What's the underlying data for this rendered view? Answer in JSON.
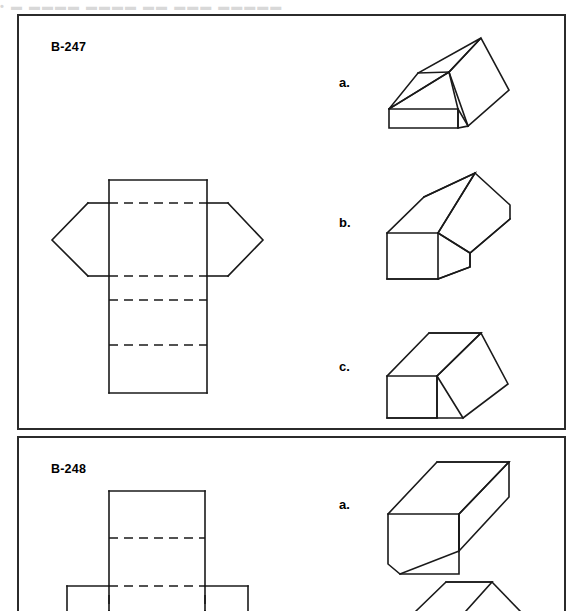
{
  "page": {
    "top_cut_text": "•  ▬ ▬▬▬▬  ▬▬▬▬ ▬▬  ▬▬▬ ▬▬▬▬▬",
    "line_color": "#1a1a1a",
    "border_color": "#2b2b2b",
    "background": "#ffffff"
  },
  "exercises": [
    {
      "id": "B-247",
      "label": "B-247",
      "net": {
        "name": "hexagonal-prism-net",
        "solid_paths": [
          "M 109 180 L 207 180",
          "M 109 180 L 109 203",
          "M 207 180 L 207 203",
          "M 88 203 L 109 203",
          "M 207 203 L 228 203",
          "M 88 203 L 52 240 L 88 276",
          "M 228 203 L 263 240 L 228 276",
          "M 88 276 L 109 276",
          "M 207 276 L 228 276",
          "M 109 203 L 109 393",
          "M 207 203 L 207 393",
          "M 109 393 L 207 393"
        ],
        "dashed_paths": [
          "M 109 203 L 207 203",
          "M 109 276 L 207 276",
          "M 109 300 L 207 300",
          "M 109 345 L 207 345"
        ]
      },
      "options": [
        {
          "letter": "a.",
          "name": "option-a-solid",
          "paths": [
            "M 389 109 L 389 128 L 458 128 L 458 109 L 389 109",
            "M 389 109 L 418 73 L 481 38 L 449 72 L 389 109",
            "M 418 73 L 449 72",
            "M 449 72 L 481 38 L 509 90 L 468 126 L 449 72",
            "M 449 72 L 458 109 L 458 128 L 468 126",
            "M 458 109 L 468 126",
            "M 389 109 L 449 72"
          ]
        },
        {
          "letter": "b.",
          "name": "option-b-solid",
          "paths": [
            "M 387 233 L 387 279 L 438 279 L 438 233 L 387 233",
            "M 387 233 L 424 197 L 475 173 L 438 233",
            "M 424 197 L 475 173",
            "M 475 173 L 510 205 L 510 219 L 470 253 L 438 233 L 475 173",
            "M 438 233 L 470 253 L 470 267 L 438 279",
            "M 470 253 L 510 219",
            "M 470 253 L 470 267 L 438 279",
            "M 387 279 L 438 279"
          ]
        },
        {
          "letter": "c.",
          "name": "option-c-solid",
          "paths": [
            "M 387 376 L 387 418 L 437 418 L 437 376 L 387 376",
            "M 387 376 L 429 333 L 481 333 L 437 376",
            "M 429 333 L 481 333",
            "M 481 333 L 508 384 L 463 418 L 437 376 L 481 333",
            "M 437 376 L 437 418 L 463 418",
            "M 387 418 L 437 418"
          ]
        }
      ]
    },
    {
      "id": "B-248",
      "label": "B-248",
      "net": {
        "name": "rectangular-prism-net",
        "solid_paths": [
          "M 109 491 L 205 491",
          "M 109 491 L 109 586",
          "M 205 491 L 205 586",
          "M 67 586 L 109 586",
          "M 205 586 L 248 586",
          "M 67 586 L 67 611",
          "M 248 586 L 248 611",
          "M 109 586 L 109 611",
          "M 205 586 L 205 611"
        ],
        "dashed_paths": [
          "M 109 538 L 205 538",
          "M 109 586 L 205 586",
          "M 109 595 L 109 611",
          "M 205 595 L 205 611"
        ]
      },
      "options": [
        {
          "letter": "a.",
          "name": "option-a-solid",
          "paths": [
            "M 388 514 L 388 564 L 400 574 L 459 574 L 459 514 L 388 514",
            "M 388 514 L 437 462 L 509 462 L 459 514",
            "M 437 462 L 509 462",
            "M 509 462 L 509 497 L 459 551 L 459 514 L 509 462",
            "M 459 514 L 459 551",
            "M 400 574 L 459 551"
          ]
        },
        {
          "letter": "",
          "name": "option-b-solid-partial",
          "paths": [
            "M 416 611 L 446 582 L 492 582 L 466 611",
            "M 446 582 L 492 582",
            "M 492 582 L 520 611"
          ]
        }
      ]
    }
  ]
}
